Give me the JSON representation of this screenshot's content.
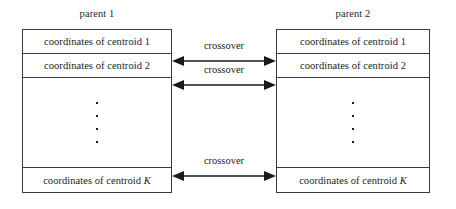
{
  "diagram": {
    "background_color": "#ffffff",
    "line_color": "#3a3a3a",
    "text_color": "#1b1b1b"
  },
  "parents": [
    {
      "caption": "parent 1",
      "genes": [
        {
          "label": "coordinates of centroid 1",
          "index_text": "1"
        },
        {
          "label": "coordinates of centroid 2",
          "index_text": "2"
        },
        {
          "label": "coordinates of centroid ",
          "index_text": "K"
        }
      ],
      "ellipsis_dots": 4
    },
    {
      "caption": "parent 2",
      "genes": [
        {
          "label": "coordinates of centroid 1",
          "index_text": "1"
        },
        {
          "label": "coordinates of centroid 2",
          "index_text": "2"
        },
        {
          "label": "coordinates of centroid ",
          "index_text": "K"
        }
      ],
      "ellipsis_dots": 4
    }
  ],
  "crossovers": [
    {
      "label": "crossover"
    },
    {
      "label": "crossover"
    },
    {
      "label": "crossover"
    }
  ]
}
